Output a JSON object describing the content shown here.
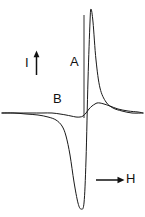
{
  "figure": {
    "background_color": "#ffffff",
    "stroke_color": "#1a1a1a",
    "width": 145,
    "height": 217,
    "axes": {
      "intensity_axis_label": "I",
      "field_axis_label": "H",
      "intensity_arrow_icon": "up-arrow-icon",
      "field_arrow_icon": "right-arrow-icon",
      "vertical_axis_name": "intensity-axis-line"
    },
    "curve_labels": {
      "curve_a": "A",
      "curve_b": "B"
    }
  },
  "chart_data": {
    "type": "line",
    "title": "",
    "xlabel": "H",
    "ylabel": "I",
    "grid": false,
    "legend": "inline-annotations",
    "xlim": [
      0,
      145
    ],
    "ylim": [
      217,
      0
    ],
    "baseline_y": 114,
    "zero_crossing_x": 84,
    "annotations": [
      {
        "text": "A",
        "x": 74,
        "y": 62,
        "describes": "large-amplitude-derivative-curve"
      },
      {
        "text": "B",
        "x": 58,
        "y": 99,
        "describes": "small-amplitude-derivative-curve"
      },
      {
        "text": "I",
        "x": 30,
        "y": 64,
        "describes": "intensity-axis-label"
      },
      {
        "text": "H",
        "x": 130,
        "y": 180,
        "describes": "magnetic-field-axis-label"
      }
    ],
    "series": [
      {
        "name": "A",
        "label": "A",
        "description": "Large-amplitude first-derivative lineshape: sharp positive peak above baseline then deep negative trough below baseline.",
        "peak_max": {
          "x": 91,
          "y": 9
        },
        "peak_min": {
          "x": 80,
          "y": 209
        },
        "points_x": [
          2,
          14,
          26,
          38,
          48,
          56,
          62,
          66,
          70,
          74,
          78,
          81,
          84,
          86,
          88,
          90,
          91,
          93,
          96,
          100,
          106,
          113,
          122,
          132,
          143
        ],
        "points_y": [
          113,
          113,
          114,
          115,
          117,
          120,
          126,
          136,
          155,
          182,
          203,
          209,
          203,
          160,
          80,
          22,
          9,
          22,
          60,
          88,
          102,
          108,
          111,
          113,
          113
        ]
      },
      {
        "name": "B",
        "label": "B",
        "description": "Small-amplitude first-derivative lineshape: shallow negative dip then small positive peak, returning to baseline.",
        "peak_max": {
          "x": 97,
          "y": 103
        },
        "peak_min": {
          "x": 76,
          "y": 117
        },
        "points_x": [
          2,
          16,
          30,
          42,
          52,
          60,
          66,
          71,
          76,
          80,
          83,
          86,
          89,
          92,
          95,
          97,
          100,
          104,
          110,
          118,
          128,
          138,
          143
        ],
        "points_y": [
          113,
          113,
          113,
          113,
          113,
          114,
          115,
          116,
          117,
          117,
          116,
          113,
          109,
          106,
          104,
          103,
          103,
          104,
          106,
          109,
          111,
          112,
          113
        ]
      }
    ]
  }
}
